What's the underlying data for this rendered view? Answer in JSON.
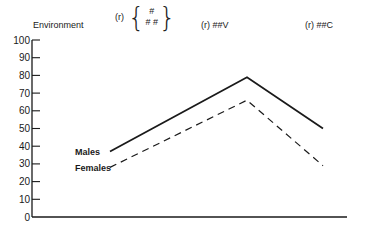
{
  "header": {
    "environment_label": "Environment",
    "col1_prefix": "(r)",
    "col1_top": "#",
    "col1_bottom": "# #",
    "col2": "(r) ##V",
    "col3": "(r) ##C"
  },
  "axis": {
    "y_ticks": [
      "100",
      "90",
      "80",
      "70",
      "60",
      "50",
      "40",
      "30",
      "20",
      "10",
      "0"
    ]
  },
  "legend": {
    "males": "Males",
    "females": "Females"
  },
  "chart_data": {
    "type": "line",
    "title": "",
    "xlabel": "Environment",
    "ylabel": "",
    "categories": [
      "(r) {#, ##}",
      "(r) ##V",
      "(r) ##C"
    ],
    "series": [
      {
        "name": "Males",
        "style": "solid",
        "values": [
          37,
          79,
          50
        ]
      },
      {
        "name": "Females",
        "style": "dashed",
        "values": [
          28,
          66,
          29
        ]
      }
    ],
    "ylim": [
      0,
      100
    ],
    "y_ticks": [
      0,
      10,
      20,
      30,
      40,
      50,
      60,
      70,
      80,
      90,
      100
    ],
    "grid": false,
    "legend_position": "inline-left"
  }
}
